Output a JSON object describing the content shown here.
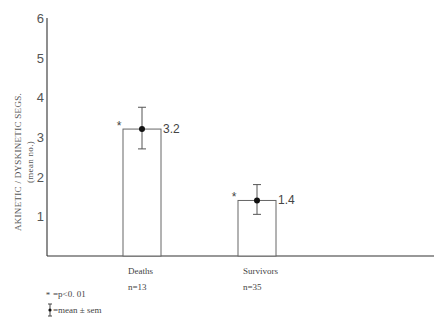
{
  "chart_data": {
    "type": "bar",
    "title": "",
    "ylabel": "AKINETIC / DYSKINETIC SEGS.",
    "ylabel_sub": "(mean no.)",
    "xlabel": "",
    "ylim": [
      0,
      6
    ],
    "yticks": [
      "1",
      "2",
      "3",
      "4",
      "5",
      "6"
    ],
    "categories": [
      "Deaths",
      "Survivors"
    ],
    "n_labels": [
      "n=13",
      "n=35"
    ],
    "values": [
      3.2,
      1.4
    ],
    "value_labels": [
      "3.2",
      "1.4"
    ],
    "sem_upper": [
      3.75,
      1.8
    ],
    "sem_lower": [
      2.7,
      1.05
    ],
    "significance": [
      "*",
      "*"
    ],
    "legend": [
      {
        "symbol": "*",
        "label": "=p<0. 01"
      },
      {
        "symbol": "error-bar",
        "label": "=mean ± sem"
      }
    ],
    "grid": false
  }
}
